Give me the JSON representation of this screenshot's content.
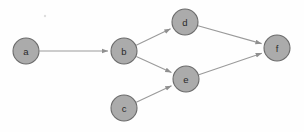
{
  "diagram": {
    "type": "directed-graph",
    "canvas": {
      "width": 304,
      "height": 132,
      "background": "#fefefe"
    },
    "style": {
      "node_fill": "#ababab",
      "node_stroke": "#6b6b6b",
      "edge_stroke": "#9a9a9a",
      "label_color": "#2a2a2a",
      "node_radius": 13
    },
    "nodes": [
      {
        "id": "a",
        "label": "a",
        "cx": 26,
        "cy": 51,
        "r": 13
      },
      {
        "id": "b",
        "label": "b",
        "cx": 124,
        "cy": 51,
        "r": 13
      },
      {
        "id": "c",
        "label": "c",
        "cx": 124,
        "cy": 108,
        "r": 13
      },
      {
        "id": "d",
        "label": "d",
        "cx": 185,
        "cy": 22,
        "r": 13
      },
      {
        "id": "e",
        "label": "e",
        "cx": 186,
        "cy": 79,
        "r": 13
      },
      {
        "id": "f",
        "label": "f",
        "cx": 277,
        "cy": 48,
        "r": 13
      }
    ],
    "edges": [
      {
        "id": "a-b",
        "from": "a",
        "to": "b",
        "directed": true
      },
      {
        "id": "b-d",
        "from": "b",
        "to": "d",
        "directed": true
      },
      {
        "id": "b-e",
        "from": "b",
        "to": "e",
        "directed": true
      },
      {
        "id": "c-e",
        "from": "c",
        "to": "e",
        "directed": true
      },
      {
        "id": "d-f",
        "from": "d",
        "to": "f",
        "directed": true
      },
      {
        "id": "e-f",
        "from": "e",
        "to": "f",
        "directed": true
      }
    ],
    "artifacts": [
      {
        "id": "speck",
        "cx": 45,
        "cy": 16,
        "r": 1.2
      }
    ]
  }
}
